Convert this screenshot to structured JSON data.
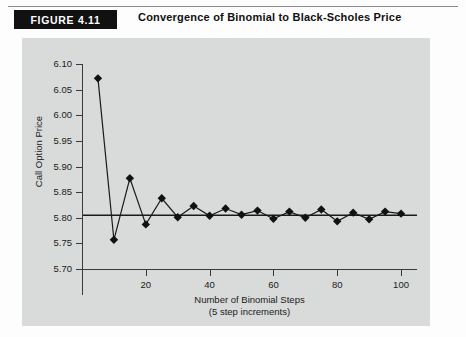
{
  "figure": {
    "badge_label": "FIGURE 4.11",
    "title": "Convergence of Binomial to Black-Scholes Price"
  },
  "chart_data": {
    "type": "line",
    "title": "Convergence of Binomial to Black-Scholes Price",
    "xlabel": "Number of Binomial Steps",
    "xlabel_sub": "(5 step increments)",
    "ylabel": "Call Option Price",
    "xlim": [
      0,
      105
    ],
    "ylim": [
      5.7,
      6.1
    ],
    "ytick_labels": [
      "6.10",
      "6.05",
      "6.00",
      "5.95",
      "5.90",
      "5.85",
      "5.80",
      "5.75",
      "5.70"
    ],
    "ytick_values": [
      6.1,
      6.05,
      6.0,
      5.95,
      5.9,
      5.85,
      5.8,
      5.75,
      5.7
    ],
    "xtick_labels": [
      "20",
      "40",
      "60",
      "80",
      "100"
    ],
    "xtick_values": [
      20,
      40,
      60,
      80,
      100
    ],
    "grid": false,
    "legend": "none",
    "marker": "diamond",
    "series": [
      {
        "name": "Binomial call option price",
        "x": [
          5,
          10,
          15,
          20,
          25,
          30,
          35,
          40,
          45,
          50,
          55,
          60,
          65,
          70,
          75,
          80,
          85,
          90,
          95,
          100
        ],
        "values": [
          6.072,
          5.757,
          5.877,
          5.787,
          5.838,
          5.801,
          5.823,
          5.804,
          5.818,
          5.806,
          5.814,
          5.798,
          5.812,
          5.8,
          5.816,
          5.793,
          5.81,
          5.797,
          5.812,
          5.808
        ]
      }
    ],
    "reference_line": {
      "name": "Black-Scholes price",
      "value": 5.805,
      "style": "solid-horizontal"
    }
  }
}
